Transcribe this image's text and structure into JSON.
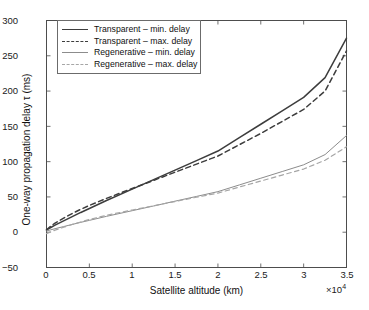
{
  "chart_data": {
    "type": "line",
    "title": "",
    "xlabel": "Satellite altitude (km)",
    "ylabel": "One-way propagation delay τ (ms)",
    "x_exponent_label": "×10",
    "x_exponent_power": "4",
    "xlim": [
      0,
      35000
    ],
    "ylim": [
      -50,
      300
    ],
    "xticks": [
      0,
      5000,
      10000,
      15000,
      20000,
      25000,
      30000,
      35000
    ],
    "xticklabels": [
      "0",
      "0.5",
      "1",
      "1.5",
      "2",
      "2.5",
      "3",
      "3.5"
    ],
    "yticks": [
      -50,
      0,
      50,
      100,
      150,
      200,
      250,
      300
    ],
    "yticklabels": [
      "−50",
      "0",
      "50",
      "100",
      "150",
      "200",
      "250",
      "300"
    ],
    "grid": false,
    "legend_position": "upper left",
    "x": [
      0,
      500,
      1000,
      2000,
      3000,
      4000,
      5000,
      7000,
      10000,
      12500,
      15000,
      17500,
      20000,
      22500,
      25000,
      27500,
      30000,
      32500,
      35000
    ],
    "series": [
      {
        "name": "Transparent – min. delay",
        "style": "solid",
        "color": "#3d3d3d",
        "width": 1.5,
        "values": [
          3.3,
          6.7,
          10.0,
          16.0,
          22.0,
          28.0,
          33.6,
          45.0,
          61.0,
          74.5,
          88.0,
          101.5,
          115.0,
          134.0,
          153.0,
          172.0,
          191.0,
          219.0,
          275.0
        ]
      },
      {
        "name": "Transparent – max. delay",
        "style": "dashed",
        "color": "#3d3d3d",
        "width": 1.5,
        "values": [
          3.3,
          8.5,
          13.0,
          20.0,
          26.5,
          32.5,
          38.0,
          48.0,
          62.0,
          73.5,
          85.0,
          96.5,
          108.0,
          124.0,
          140.0,
          157.0,
          174.0,
          200.0,
          257.0
        ]
      },
      {
        "name": "Regenerative – min. delay",
        "style": "solid",
        "color": "#8c8c8c",
        "width": 1.0,
        "values": [
          1.7,
          3.4,
          5.0,
          8.0,
          11.0,
          14.0,
          16.8,
          22.5,
          30.5,
          37.2,
          44.0,
          50.7,
          57.5,
          67.0,
          76.5,
          86.0,
          95.5,
          110.0,
          137.0
        ]
      },
      {
        "name": "Regenerative – max. delay",
        "style": "dashed",
        "color": "#a6a6a6",
        "width": 1.2,
        "values": [
          -2.0,
          0.5,
          3.0,
          7.0,
          11.0,
          14.5,
          18.0,
          24.0,
          31.5,
          37.5,
          43.5,
          49.5,
          55.5,
          64.0,
          72.5,
          81.0,
          89.5,
          102.0,
          121.0
        ]
      }
    ]
  },
  "legend": {
    "items": [
      {
        "label": "Transparent – min. delay"
      },
      {
        "label": "Transparent – max. delay"
      },
      {
        "label": "Regenerative – min. delay"
      },
      {
        "label": "Regenerative – max. delay"
      }
    ]
  }
}
